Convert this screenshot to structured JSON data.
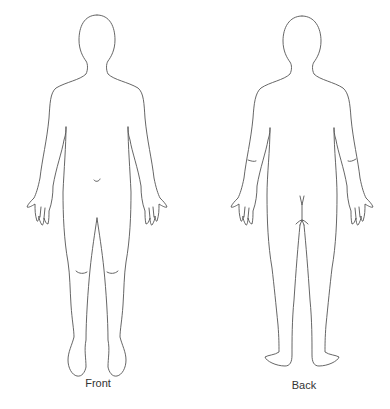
{
  "diagram": {
    "type": "body-outline-chart",
    "stroke_color": "#555555",
    "background_color": "#ffffff",
    "views": [
      {
        "id": "front",
        "label": "Front"
      },
      {
        "id": "back",
        "label": "Back"
      }
    ]
  }
}
